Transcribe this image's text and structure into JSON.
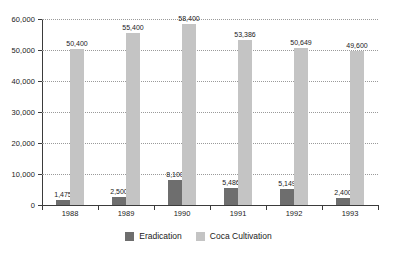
{
  "chart_data": {
    "type": "bar",
    "title": "",
    "subtitle": "",
    "xlabel": "",
    "ylabel": "",
    "categories": [
      "1988",
      "1989",
      "1990",
      "1991",
      "1992",
      "1993"
    ],
    "series": [
      {
        "name": "Eradication",
        "color": "#6e6e6e",
        "values": [
          1475,
          2500,
          8100,
          5486,
          5149,
          2400
        ],
        "labels": [
          "1,475",
          "2,500",
          "8,100",
          "5,486",
          "5,149",
          "2,400"
        ]
      },
      {
        "name": "Coca Cultivation",
        "color": "#c4c4c4",
        "values": [
          50400,
          55400,
          58400,
          53386,
          50649,
          49600
        ],
        "labels": [
          "50,400",
          "55,400",
          "58,400",
          "53,386",
          "50,649",
          "49,600"
        ]
      }
    ],
    "ylim": [
      0,
      60000
    ],
    "yticks": [
      0,
      10000,
      20000,
      30000,
      40000,
      50000,
      60000
    ],
    "ytick_labels": [
      "0",
      "10,000",
      "20,000",
      "30,000",
      "40,000",
      "50,000",
      "60,000"
    ],
    "grid": true,
    "grid_style": "dotted-horizontal",
    "legend_position": "bottom-center",
    "background": "#ffffff"
  }
}
